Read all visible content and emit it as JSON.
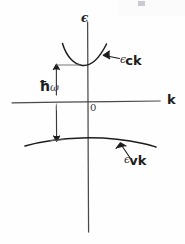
{
  "figure": {
    "kind": "hand-drawn-sketch",
    "ink_color": "#1d1d1d",
    "background_color": "#fefefe"
  },
  "axes": {
    "vertical": {
      "label": "ϵ",
      "name": "energy-axis",
      "x": 88,
      "y_top": 22,
      "y_bottom": 232
    },
    "horizontal": {
      "label": "k",
      "name": "momentum-axis",
      "y": 102,
      "x_left": 12,
      "x_right": 160
    },
    "origin_label": "0"
  },
  "curves": {
    "conduction": {
      "label_epsilon": "ϵ",
      "label_subscript": "ck",
      "name": "conduction-band-curve",
      "shape": "upward-parabola",
      "vertex_x": 88,
      "vertex_y": 64,
      "x_left": 62,
      "x_right": 107
    },
    "valence": {
      "label_epsilon": "ϵ",
      "label_subscript": "vk",
      "name": "valence-band-curve",
      "shape": "downward-parabola",
      "vertex_x": 88,
      "vertex_y": 138,
      "x_left": 25,
      "x_right": 155
    }
  },
  "annotations": {
    "transition_arrow": {
      "label_hbar": "ħ",
      "label_omega": "ω",
      "name": "photon-energy-arrow",
      "x": 56,
      "y_top": 64,
      "y_bottom": 141,
      "double_headed": true
    },
    "conduction_pointer": {
      "name": "conduction-band-pointer",
      "from_x": 118,
      "from_y": 58,
      "to_x": 103,
      "to_y": 56
    },
    "valence_pointer": {
      "name": "valence-band-pointer",
      "from_x": 130,
      "from_y": 158,
      "to_x": 120,
      "to_y": 143
    }
  }
}
